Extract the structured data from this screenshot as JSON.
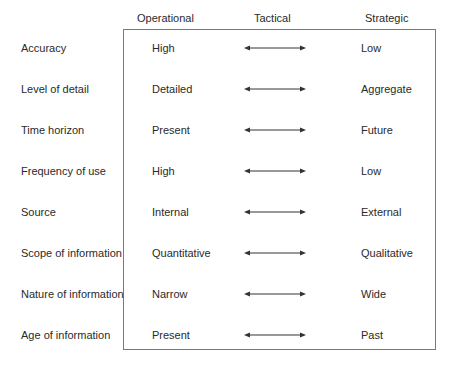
{
  "headers": {
    "operational": "Operational",
    "tactical": "Tactical",
    "strategic": "Strategic"
  },
  "rows": [
    {
      "label": "Accuracy",
      "operational": "High",
      "strategic": "Low",
      "connector": "double-arrow-icon"
    },
    {
      "label": "Level of detail",
      "operational": "Detailed",
      "strategic": "Aggregate",
      "connector": "double-arrow-icon"
    },
    {
      "label": "Time horizon",
      "operational": "Present",
      "strategic": "Future",
      "connector": "double-arrow-icon"
    },
    {
      "label": "Frequency of use",
      "operational": "High",
      "strategic": "Low",
      "connector": "double-arrow-icon"
    },
    {
      "label": "Source",
      "operational": "Internal",
      "strategic": "External",
      "connector": "double-arrow-icon"
    },
    {
      "label": "Scope of information",
      "operational": "Quantitative",
      "strategic": "Qualitative",
      "connector": "double-arrow-icon"
    },
    {
      "label": "Nature of information",
      "operational": "Narrow",
      "strategic": "Wide",
      "connector": "double-arrow-icon"
    },
    {
      "label": "Age of information",
      "operational": "Present",
      "strategic": "Past",
      "connector": "double-arrow-icon"
    }
  ],
  "colors": {
    "text": "#2a2a2a",
    "border": "#7a7a7a",
    "arrow": "#333333"
  }
}
